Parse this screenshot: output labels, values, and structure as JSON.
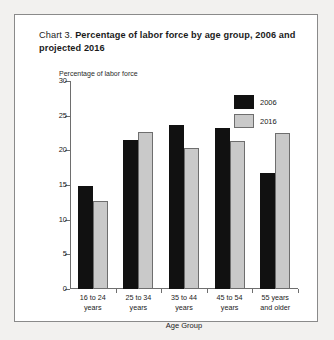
{
  "chart_data": {
    "type": "bar",
    "title": "Chart 3. Percentage of labor force by age group, 2006 and projected 2016",
    "title_prefix": "Chart 3.",
    "title_main": "Percentage of labor force by age group, 2006 and projected 2016",
    "categories": [
      "16 to 24 years",
      "25 to 34 years",
      "35 to 44 years",
      "45 to 54 years",
      "55 years and older"
    ],
    "category_lines": [
      [
        "16 to 24",
        "years"
      ],
      [
        "25 to 34",
        "years"
      ],
      [
        "35 to 44",
        "years"
      ],
      [
        "45 to 54",
        "years"
      ],
      [
        "55 years",
        "and older"
      ]
    ],
    "series": [
      {
        "name": "2006",
        "color": "#111111",
        "values": [
          14.8,
          21.5,
          23.6,
          23.2,
          16.8
        ]
      },
      {
        "name": "2016",
        "color": "#c9c9c9",
        "values": [
          12.7,
          22.6,
          20.4,
          21.3,
          22.5
        ]
      }
    ],
    "xlabel": "Age Group",
    "ylabel": "Percentage of labor force",
    "ylim": [
      0,
      30
    ],
    "yticks": [
      0,
      5,
      10,
      15,
      20,
      25,
      30
    ],
    "ytick_labels": [
      "0",
      "5",
      "10",
      "15",
      "20",
      "25",
      "30"
    ],
    "grid": false,
    "legend_position": "top-right"
  }
}
